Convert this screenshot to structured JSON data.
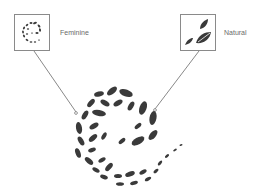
{
  "callouts": [
    {
      "label": "Feminine"
    },
    {
      "label": "Natural"
    }
  ],
  "colors": {
    "leaf": "#3a3a3a",
    "line": "#555555",
    "border": "#8a8a8a",
    "text": "#6a6a6a"
  }
}
